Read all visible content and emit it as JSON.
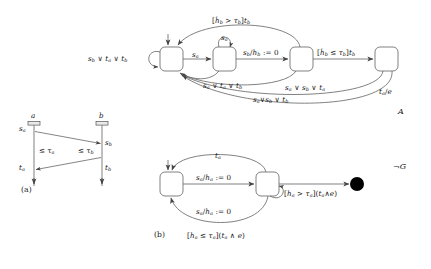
{
  "figure": {
    "caption_a": "(a)",
    "caption_b": "(b)",
    "automaton_label": "A",
    "observer_label": "¬G"
  },
  "msc": {
    "lifeline_a_label": "a",
    "lifeline_b_label": "b",
    "events": {
      "send_a": "s",
      "send_a_sub": "a",
      "recv_b": "s",
      "recv_b_sub": "b",
      "timeout_a": "t",
      "timeout_a_sub": "a",
      "timeout_b": "t",
      "timeout_b_sub": "b"
    },
    "constraint_a": "≤ τ",
    "constraint_a_sub": "a",
    "constraint_b": "≤ τ",
    "constraint_b_sub": "b"
  },
  "automaton_a": {
    "states": [
      "q0",
      "q1",
      "q2",
      "q3"
    ],
    "transitions": [
      {
        "name": "self-loop-q0",
        "label": "sb ∨ ta ∨ tb",
        "text": "sb ∨ ta ∨ tb"
      },
      {
        "name": "q0-to-q1",
        "text": "sa"
      },
      {
        "name": "self-loop-q1",
        "text": "sa"
      },
      {
        "name": "q1-to-q2",
        "text": "sb/hb := 0"
      },
      {
        "name": "q2-to-q3",
        "text": "[ḣb ≤ τb]tb"
      },
      {
        "name": "q2-to-q0-top",
        "text": "[ḣb > τb]tb"
      },
      {
        "name": "q1-to-q0",
        "text": "sa ∨ ta ∨ tb"
      },
      {
        "name": "q2-to-q0-mid",
        "text": "sa ∨ sb ∨ ta"
      },
      {
        "name": "q3-to-q0-lower",
        "text": "sa∨sb ∨ tb"
      },
      {
        "name": "q3-to-q0-out",
        "text": "ta/e"
      }
    ],
    "labels": {
      "top_guard": "[ḣ",
      "top_guard_sub": "b",
      "top_guard_rel": " > τ",
      "top_guard_sub2": "b",
      "top_guard_tail": "]t",
      "top_guard_sub3": "b",
      "right_guard_rel": " ≤ τ",
      "self_q1": "s",
      "self_q1_sub": "a",
      "q0_q1": "s",
      "q0_q1_sub": "a",
      "reset": "/h",
      "reset_assign": " := 0",
      "out": "/e"
    }
  },
  "observer_g": {
    "states": [
      "p0",
      "p1",
      "accept"
    ],
    "transitions": [
      {
        "name": "p1-to-p0-top",
        "text": "ta"
      },
      {
        "name": "p0-to-p1",
        "text": "sa/ha := 0"
      },
      {
        "name": "self-loop-p1",
        "text": "sa/ha := 0"
      },
      {
        "name": "p1-to-accept",
        "text": "[ha > τa](ta ∧ e)"
      },
      {
        "name": "p1-to-p0-bot",
        "text": "[ha ≤ τa](ta ∧ e)"
      }
    ]
  },
  "symbols": {
    "s": "s",
    "t": "t",
    "h": "h",
    "hdot": "ḣ",
    "tau": "τ",
    "e": "e",
    "or": "∨",
    "and": "∧",
    "leq": "≤",
    "gt": ">",
    "assign": ":= 0",
    "not": "¬",
    "G": "G",
    "A": "A",
    "sub_a": "a",
    "sub_b": "b"
  },
  "colors": {
    "stroke": "#555555",
    "text": "#171717",
    "background": "#ffffff",
    "accept_fill": "#000000"
  }
}
